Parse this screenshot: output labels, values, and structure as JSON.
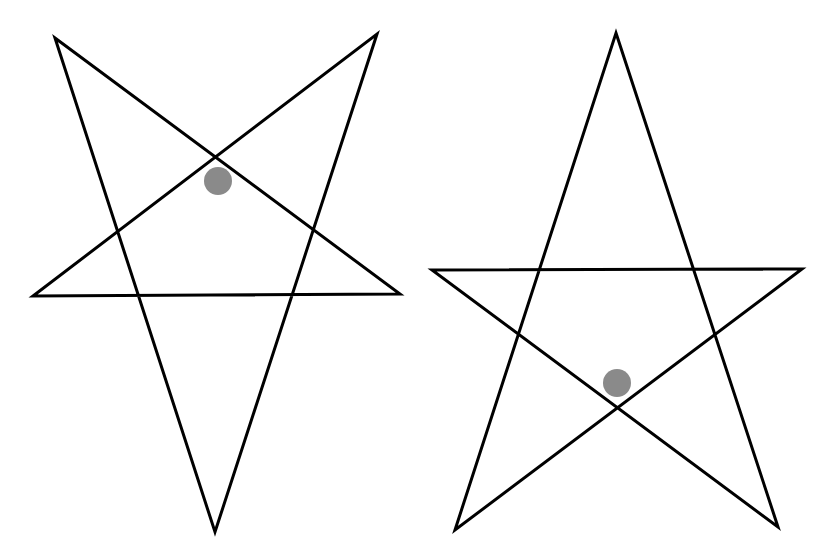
{
  "canvas": {
    "width": 821,
    "height": 559,
    "background": "#ffffff"
  },
  "stroke": {
    "color": "#000000",
    "width": 3
  },
  "dot_color": "#8a8a8a",
  "stars": [
    {
      "name": "inverted-star",
      "points": "55,38 400,294 33,296 377,34 215,532",
      "dot": {
        "cx": 218,
        "cy": 181,
        "r": 14
      }
    },
    {
      "name": "upright-star",
      "points": "616,33 778,527 432,270 802,269 455,530",
      "dot": {
        "cx": 617,
        "cy": 383,
        "r": 14
      }
    }
  ]
}
